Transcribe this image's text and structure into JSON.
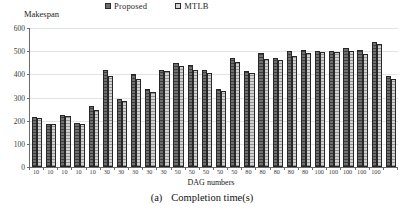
{
  "figure": {
    "caption_index": "(a)",
    "caption_text": "Completion time(s)"
  },
  "legend": {
    "items": [
      {
        "label": "Proposed",
        "color": "#6f6f6f"
      },
      {
        "label": "MTLB",
        "color": "#d2d2d2"
      }
    ]
  },
  "chart_data": {
    "type": "bar",
    "title": "",
    "ylabel": "Makespan",
    "xlabel": "DAG numbers",
    "ylim": [
      0,
      600
    ],
    "yticks": [
      0,
      100,
      200,
      300,
      400,
      500,
      600
    ],
    "grid": true,
    "legend_position": "top-center",
    "categories": [
      "10",
      "10",
      "10",
      "10",
      "10",
      "30",
      "30",
      "30",
      "30",
      "30",
      "50",
      "50",
      "50",
      "50",
      "50",
      "80",
      "80",
      "80",
      "80",
      "80",
      "100",
      "100",
      "100",
      "100",
      "100"
    ],
    "series": [
      {
        "name": "Proposed",
        "color": "#6f6f6f",
        "values": [
          215,
          187,
          225,
          188,
          262,
          420,
          295,
          400,
          338,
          418,
          450,
          440,
          420,
          338,
          470,
          415,
          493,
          472,
          500,
          505,
          500,
          500,
          512,
          505,
          540
        ]
      },
      {
        "name": "MTLB",
        "color": "#d2d2d2",
        "values": [
          212,
          185,
          222,
          186,
          248,
          395,
          285,
          380,
          325,
          413,
          435,
          420,
          405,
          330,
          452,
          405,
          465,
          460,
          478,
          490,
          495,
          497,
          502,
          488,
          530
        ]
      }
    ],
    "trailing_single": {
      "series": "Proposed",
      "value": 395,
      "paired_value": 378
    }
  }
}
